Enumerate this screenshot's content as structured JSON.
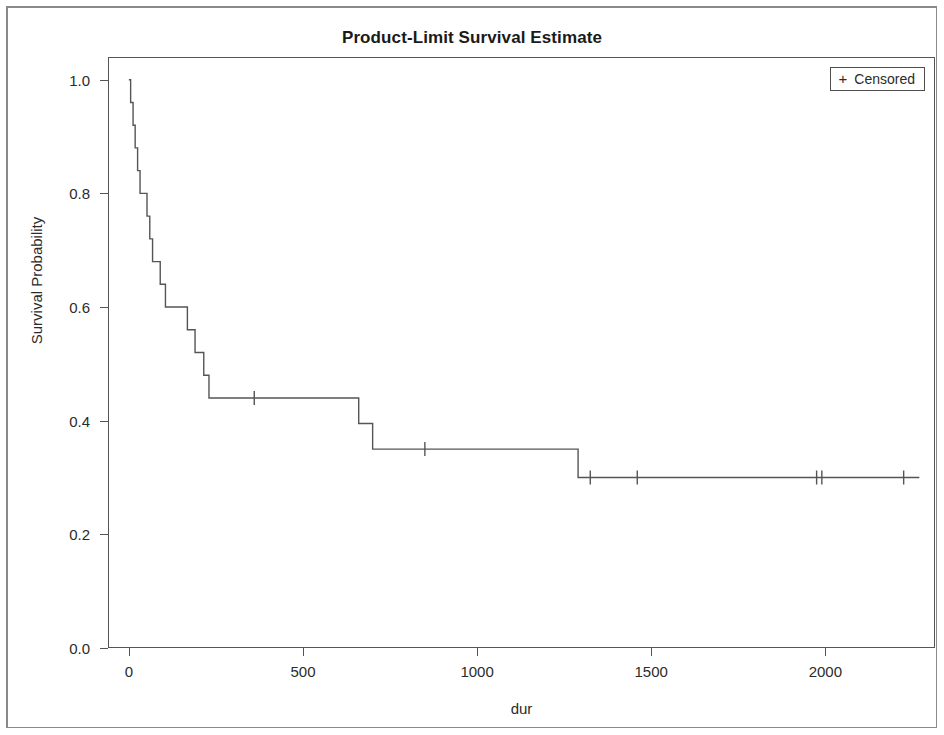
{
  "chart_data": {
    "type": "line",
    "subtype": "kaplan-meier-step",
    "title": "Product-Limit Survival Estimate",
    "xlabel": "dur",
    "ylabel": "Survival Probability",
    "xlim": [
      -60,
      2315
    ],
    "ylim": [
      0.0,
      1.04
    ],
    "grid": false,
    "legend": {
      "position": "top-right",
      "entries": [
        {
          "marker": "+",
          "label": "Censored"
        }
      ]
    },
    "xticks": [
      0,
      500,
      1000,
      1500,
      2000
    ],
    "xtick_labels": [
      "0",
      "500",
      "1000",
      "1500",
      "2000"
    ],
    "yticks": [
      0.0,
      0.2,
      0.4,
      0.6,
      0.8,
      1.0
    ],
    "ytick_labels": [
      "0.0",
      "0.2",
      "0.4",
      "0.6",
      "0.8",
      "1.0"
    ],
    "series": [
      {
        "name": "Survival Probability",
        "step": "post",
        "color": "#555555",
        "x": [
          0,
          5,
          12,
          18,
          25,
          32,
          40,
          52,
          60,
          68,
          78,
          90,
          105,
          120,
          135,
          150,
          168,
          178,
          190,
          205,
          215,
          222,
          230,
          640,
          660,
          700,
          1290,
          2270
        ],
        "y": [
          1.0,
          0.96,
          0.92,
          0.88,
          0.84,
          0.8,
          0.8,
          0.76,
          0.72,
          0.68,
          0.68,
          0.64,
          0.6,
          0.6,
          0.6,
          0.6,
          0.56,
          0.56,
          0.52,
          0.52,
          0.48,
          0.48,
          0.44,
          0.44,
          0.395,
          0.35,
          0.3,
          0.3
        ]
      }
    ],
    "censored_points": [
      {
        "x": 360,
        "y": 0.44
      },
      {
        "x": 850,
        "y": 0.35
      },
      {
        "x": 1325,
        "y": 0.3
      },
      {
        "x": 1460,
        "y": 0.3
      },
      {
        "x": 1975,
        "y": 0.3
      },
      {
        "x": 1990,
        "y": 0.3
      },
      {
        "x": 2225,
        "y": 0.3
      }
    ],
    "colors": {
      "curve": "#555555",
      "axis": "#555555",
      "text": "#2b2b2b",
      "background": "#ffffff",
      "frame": "#8a8a8a"
    }
  }
}
